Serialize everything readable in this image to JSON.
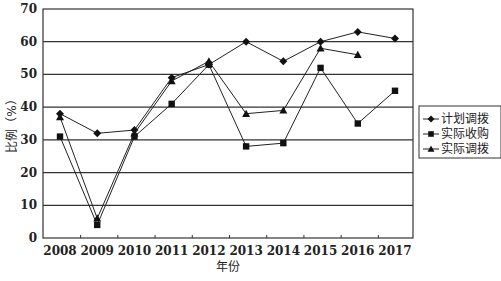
{
  "chart_data": {
    "type": "line",
    "title": "",
    "xlabel": "年份",
    "ylabel": "比例（%）",
    "ylim": [
      0,
      70
    ],
    "yticks": [
      0,
      10,
      20,
      30,
      40,
      50,
      60,
      70
    ],
    "grid": true,
    "legend_position": "right",
    "categories": [
      "2008",
      "2009",
      "2010",
      "2011",
      "2012",
      "2013",
      "2014",
      "2015",
      "2016",
      "2017"
    ],
    "series": [
      {
        "name": "计划调拨",
        "marker": "diamond",
        "values": [
          38,
          32,
          33,
          49,
          53,
          60,
          54,
          60,
          63,
          61
        ]
      },
      {
        "name": "实际收购",
        "marker": "square",
        "values": [
          31,
          4,
          31,
          41,
          53,
          28,
          29,
          52,
          35,
          45
        ]
      },
      {
        "name": "实际调拨",
        "marker": "triangle",
        "values": [
          37,
          6,
          32,
          48,
          54,
          38,
          39,
          58,
          56,
          null
        ]
      }
    ]
  },
  "colors": {
    "line": "#222222",
    "grid": "#333333"
  }
}
